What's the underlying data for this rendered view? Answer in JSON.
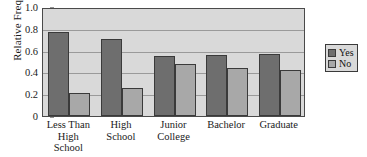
{
  "chart_data": {
    "type": "bar",
    "title": "",
    "xlabel": "",
    "ylabel": "Relative Frequency",
    "ylim": [
      0,
      1.0
    ],
    "ytick_labels": [
      "0",
      "0.2",
      "0.4",
      "0.6",
      "0.8",
      "1.0"
    ],
    "ytick_values": [
      0,
      0.2,
      0.4,
      0.6,
      0.8,
      1.0
    ],
    "grid": true,
    "legend_position": "right-outside",
    "categories": [
      "Less Than High School",
      "High School",
      "Junior College",
      "Bachelor",
      "Graduate"
    ],
    "category_lines": [
      [
        "Less Than",
        "High",
        "School"
      ],
      [
        "High",
        "School"
      ],
      [
        "Junior",
        "College"
      ],
      [
        "Bachelor"
      ],
      [
        "Graduate"
      ]
    ],
    "series": [
      {
        "name": "Yes",
        "color": "#6e6e6e",
        "values": [
          0.77,
          0.71,
          0.55,
          0.56,
          0.57
        ]
      },
      {
        "name": "No",
        "color": "#a8a8a8",
        "values": [
          0.21,
          0.26,
          0.48,
          0.44,
          0.42
        ]
      }
    ]
  },
  "legend": {
    "items": [
      {
        "label": "Yes"
      },
      {
        "label": "No"
      }
    ]
  },
  "colors": {
    "plot_background": "#d9d9d9",
    "gridline": "#9a9a9a",
    "axis": "#4a4a4a",
    "series_yes": "#6e6e6e",
    "series_no": "#a8a8a8"
  }
}
